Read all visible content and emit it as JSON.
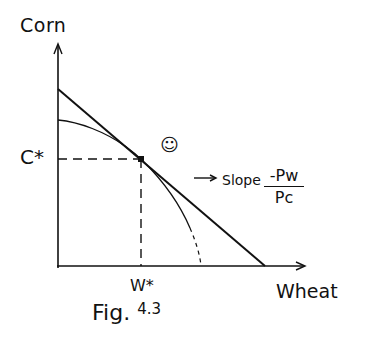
{
  "figure": {
    "caption": "Fig.",
    "caption_number": "4.3",
    "y_axis_label": "Corn",
    "x_axis_label": "Wheat",
    "y_optimum_label": "C*",
    "x_optimum_label": "W*",
    "slope_label": "Slope",
    "slope_numerator": "-Pw",
    "slope_denominator": "Pc",
    "optimum_marker": "☺"
  },
  "diagram": {
    "elements": [
      "production possibilities frontier (concave curve)",
      "budget/price line tangent at optimum",
      "dashed guide lines to C* and W*",
      "arrow pointing to budget line with slope label"
    ]
  }
}
